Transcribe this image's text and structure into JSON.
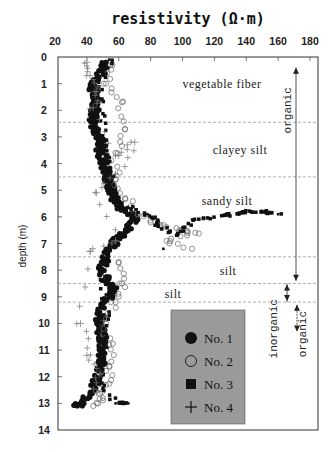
{
  "chart_data": {
    "type": "scatter",
    "title": "resistivity (Ω·m)",
    "xlabel": "resistivity (Ω·m)",
    "ylabel": "depth (m)",
    "xlim": [
      20,
      180
    ],
    "ylim": [
      0,
      14
    ],
    "y_inverted": true,
    "x_axis_position": "top",
    "x_ticks": [
      20,
      40,
      60,
      80,
      100,
      120,
      140,
      160,
      180
    ],
    "y_ticks": [
      0,
      1,
      2,
      3,
      4,
      5,
      6,
      7,
      8,
      9,
      10,
      11,
      12,
      13,
      14
    ],
    "grid": false,
    "legend_position": "lower right (inside)",
    "layer_boundaries_depth": [
      2.45,
      4.5,
      7.5,
      8.5,
      9.2
    ],
    "layers": [
      {
        "label": "vegetable fiber",
        "depth_label": 1.0
      },
      {
        "label": "clayey silt",
        "depth_label": 3.5
      },
      {
        "label": "sandy silt",
        "depth_label": 5.4
      },
      {
        "label": "silt",
        "depth_label": 8.05
      },
      {
        "label": "silt",
        "depth_label": 8.9
      }
    ],
    "annotations": [
      {
        "text": "organic",
        "from_depth": 0.4,
        "to_depth": 8.4,
        "arrow": "both",
        "orientation": "vertical"
      },
      {
        "text": "inorganic",
        "from_depth": 8.5,
        "to_depth": 9.2,
        "arrow": "both",
        "orientation": "vertical"
      },
      {
        "text": "organic",
        "from_depth": 9.3,
        "to_depth": 10.3,
        "arrow": "both",
        "orientation": "vertical"
      }
    ],
    "series": [
      {
        "name": "No. 1",
        "marker": "filled-circle",
        "points": [
          [
            52,
            0.2
          ],
          [
            50,
            0.5
          ],
          [
            45,
            0.9
          ],
          [
            44,
            1.2
          ],
          [
            45,
            1.5
          ],
          [
            46,
            1.8
          ],
          [
            45,
            2.1
          ],
          [
            44,
            2.4
          ],
          [
            46,
            2.7
          ],
          [
            48,
            3.0
          ],
          [
            47,
            3.3
          ],
          [
            49,
            3.6
          ],
          [
            50,
            3.9
          ],
          [
            52,
            4.2
          ],
          [
            53,
            4.5
          ],
          [
            54,
            4.8
          ],
          [
            56,
            5.1
          ],
          [
            58,
            5.4
          ],
          [
            62,
            5.7
          ],
          [
            68,
            5.9
          ],
          [
            72,
            6.1
          ],
          [
            66,
            6.4
          ],
          [
            62,
            6.7
          ],
          [
            58,
            6.9
          ],
          [
            54,
            7.2
          ],
          [
            52,
            7.6
          ],
          [
            50,
            8.0
          ],
          [
            52,
            8.4
          ],
          [
            56,
            8.7
          ],
          [
            54,
            9.0
          ],
          [
            50,
            9.4
          ],
          [
            48,
            9.8
          ],
          [
            48,
            10.2
          ],
          [
            50,
            10.6
          ],
          [
            50,
            11.0
          ],
          [
            49,
            11.4
          ],
          [
            48,
            11.8
          ],
          [
            46,
            12.2
          ],
          [
            42,
            12.6
          ],
          [
            36,
            13.0
          ],
          [
            34,
            13.1
          ]
        ]
      },
      {
        "name": "No. 2",
        "marker": "open-circle",
        "points": [
          [
            56,
            0.3
          ],
          [
            52,
            1.0
          ],
          [
            62,
            1.7
          ],
          [
            64,
            2.7
          ],
          [
            58,
            3.6
          ],
          [
            58,
            4.6
          ],
          [
            64,
            5.3
          ],
          [
            72,
            5.9
          ],
          [
            86,
            6.3
          ],
          [
            98,
            6.5
          ],
          [
            108,
            6.6
          ],
          [
            90,
            6.9
          ],
          [
            106,
            7.2
          ],
          [
            60,
            7.7
          ],
          [
            62,
            8.5
          ],
          [
            58,
            9.2
          ],
          [
            52,
            10.0
          ],
          [
            54,
            10.8
          ],
          [
            54,
            11.6
          ],
          [
            52,
            12.3
          ],
          [
            50,
            12.8
          ],
          [
            44,
            13.1
          ]
        ]
      },
      {
        "name": "No. 3",
        "marker": "filled-square",
        "points": [
          [
            54,
            0.1
          ],
          [
            47,
            1.1
          ],
          [
            48,
            2.0
          ],
          [
            50,
            3.1
          ],
          [
            52,
            4.0
          ],
          [
            60,
            5.5
          ],
          [
            78,
            5.9
          ],
          [
            84,
            6.3
          ],
          [
            96,
            6.7
          ],
          [
            106,
            6.1
          ],
          [
            128,
            5.95
          ],
          [
            138,
            5.8
          ],
          [
            152,
            5.8
          ],
          [
            160,
            5.9
          ],
          [
            88,
            7.2
          ],
          [
            50,
            7.8
          ],
          [
            52,
            9.1
          ],
          [
            50,
            10.4
          ],
          [
            50,
            11.2
          ],
          [
            48,
            12.0
          ],
          [
            58,
            13.0
          ],
          [
            66,
            13.0
          ]
        ]
      },
      {
        "name": "No. 4",
        "marker": "plus",
        "points": [
          [
            40,
            0.2
          ],
          [
            42,
            0.7
          ],
          [
            46,
            1.3
          ],
          [
            44,
            1.9
          ],
          [
            60,
            3.7
          ],
          [
            70,
            3.2
          ],
          [
            58,
            4.4
          ],
          [
            46,
            5.1
          ],
          [
            58,
            6.9
          ],
          [
            42,
            7.3
          ],
          [
            36,
            10.0
          ],
          [
            40,
            11.2
          ],
          [
            48,
            11.9
          ],
          [
            46,
            12.6
          ]
        ]
      }
    ]
  },
  "legend": {
    "items": [
      {
        "label": "No. 1",
        "marker": "filled-circle"
      },
      {
        "label": "No. 2",
        "marker": "open-circle"
      },
      {
        "label": "No. 3",
        "marker": "filled-square"
      },
      {
        "label": "No. 4",
        "marker": "plus"
      }
    ],
    "background": "#9a9a9a"
  },
  "colors": {
    "marker": "#111111",
    "frame": "#333333",
    "boundary_line": "#9a9a9a",
    "legend_bg": "#9a9a9a"
  }
}
